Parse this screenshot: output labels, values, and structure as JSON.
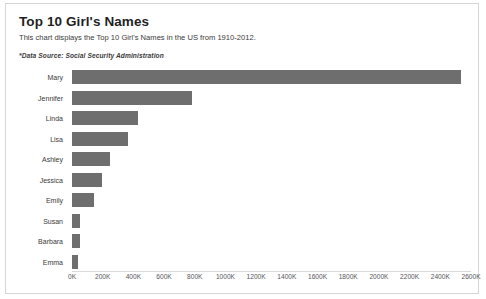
{
  "card": {
    "title": "Top 10 Girl's Names",
    "subtitle": "This chart displays the Top 10 Girl's Names in the US from 1910-2012.",
    "source_note": "*Data Source: Social Security Administration"
  },
  "colors": {
    "bar": "#6e6e6e",
    "card_border": "#d5d5d5",
    "axis_line": "#d9d9d9",
    "text": "#3a3a3a",
    "title_text": "#1f1f1f"
  },
  "chart_data": {
    "type": "bar",
    "orientation": "horizontal",
    "title": "Top 10 Girl's Names",
    "subtitle": "This chart displays the Top 10 Girl's Names in the US from 1910-2012.",
    "source": "*Data Source: Social Security Administration",
    "xlabel": "",
    "ylabel": "",
    "categories": [
      "Mary",
      "Jennifer",
      "Linda",
      "Lisa",
      "Ashley",
      "Jessica",
      "Emily",
      "Susan",
      "Barbara",
      "Emma"
    ],
    "values": [
      2533000,
      781000,
      433000,
      368000,
      250000,
      197000,
      144000,
      52000,
      50000,
      40000
    ],
    "value_unit": "births",
    "xlim": [
      0,
      2600000
    ],
    "tick_values": [
      0,
      200000,
      400000,
      600000,
      800000,
      1000000,
      1200000,
      1400000,
      1600000,
      1800000,
      2000000,
      2200000,
      2400000,
      2600000
    ],
    "tick_labels": [
      "0K",
      "200K",
      "400K",
      "600K",
      "800K",
      "1000K",
      "1200K",
      "1400K",
      "1600K",
      "1800K",
      "2000K",
      "2200K",
      "2400K",
      "2600K"
    ],
    "grid": false,
    "legend": false,
    "series": [
      {
        "name": "Count",
        "values": [
          2533000,
          781000,
          433000,
          368000,
          250000,
          197000,
          144000,
          52000,
          50000,
          40000
        ]
      }
    ]
  }
}
